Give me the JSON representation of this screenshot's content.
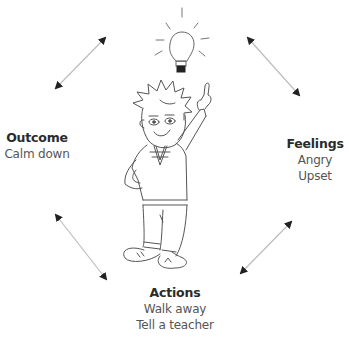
{
  "diagram": {
    "type": "cycle",
    "center_figure": "cartoon boy with idea lightbulb, pointing up",
    "nodes": {
      "outcome": {
        "title": "Outcome",
        "lines": [
          "Calm down"
        ]
      },
      "feelings": {
        "title": "Feelings",
        "lines": [
          "Angry",
          "Upset"
        ]
      },
      "actions": {
        "title": "Actions",
        "lines": [
          "Walk away",
          "Tell a teacher"
        ]
      },
      "idea": {
        "icon": "lightbulb-icon"
      }
    },
    "arrows": [
      {
        "from": "idea",
        "to": "outcome",
        "style": "double-headed"
      },
      {
        "from": "idea",
        "to": "feelings",
        "style": "double-headed"
      },
      {
        "from": "outcome",
        "to": "actions",
        "style": "double-headed"
      },
      {
        "from": "feelings",
        "to": "actions",
        "style": "double-headed"
      }
    ],
    "colors": {
      "line": "#bdbdbd",
      "arrowhead": "#222222",
      "drawing": "#555555",
      "text": "#4a4a4a"
    }
  }
}
